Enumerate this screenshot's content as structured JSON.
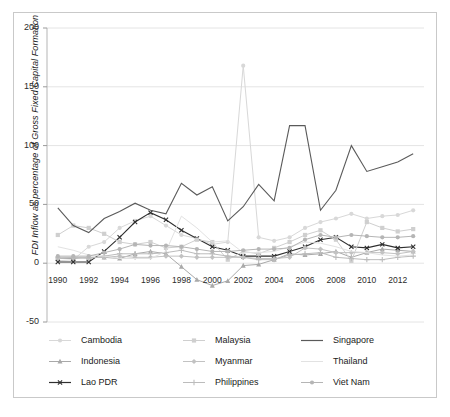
{
  "chart_data": {
    "type": "line",
    "title": "",
    "xlabel": "",
    "ylabel": "FDI Inflow as percentage of Gross Fixed Capital Formation",
    "x": [
      1990,
      1991,
      1992,
      1993,
      1994,
      1995,
      1996,
      1997,
      1998,
      1999,
      2000,
      2001,
      2002,
      2003,
      2004,
      2005,
      2006,
      2007,
      2008,
      2009,
      2010,
      2011,
      2012,
      2013
    ],
    "xlim": [
      1989.3,
      2013.7
    ],
    "ylim": [
      -50,
      200
    ],
    "yticks": [
      -50,
      0,
      50,
      100,
      150,
      200
    ],
    "xticks": [
      1990,
      1992,
      1994,
      1996,
      1998,
      2000,
      2002,
      2004,
      2006,
      2008,
      2010,
      2012
    ],
    "xtick_labels": [
      "1990",
      "1992",
      "1994",
      "1996",
      "1998",
      "2000",
      "2002",
      "2004",
      "2006",
      "2008",
      "2010",
      "2012"
    ],
    "ytick_labels": [
      "-50",
      "0",
      "50",
      "100",
      "150",
      "200"
    ],
    "grid": "horizontal",
    "legend_position": "bottom",
    "series": [
      {
        "name": "Cambodia",
        "color": "#d8d8d8",
        "marker": "circle",
        "values": [
          2,
          3,
          14,
          18,
          30,
          36,
          40,
          32,
          24,
          21,
          16,
          18,
          168,
          22,
          19,
          22,
          30,
          35,
          38,
          42,
          38,
          40,
          41,
          45
        ]
      },
      {
        "name": "Indonesia",
        "color": "#a9a9a9",
        "marker": "triangle",
        "values": [
          4,
          4,
          5,
          5,
          4,
          8,
          10,
          8,
          -3,
          -14,
          -19,
          -15,
          -2,
          -1,
          3,
          8,
          7,
          8,
          10,
          5,
          9,
          12,
          11,
          10
        ]
      },
      {
        "name": "Lao PDR",
        "color": "#2f2f2f",
        "marker": "x",
        "values": [
          1,
          1,
          1,
          10,
          22,
          35,
          43,
          37,
          28,
          21,
          14,
          11,
          6,
          6,
          6,
          10,
          14,
          20,
          22,
          14,
          13,
          16,
          13,
          14
        ]
      },
      {
        "name": "Malaysia",
        "color": "#cfcfcf",
        "marker": "square",
        "values": [
          24,
          32,
          30,
          25,
          18,
          16,
          18,
          13,
          14,
          20,
          18,
          3,
          10,
          8,
          13,
          18,
          24,
          28,
          20,
          2,
          35,
          30,
          27,
          29
        ]
      },
      {
        "name": "Myanmar",
        "color": "#c2c2c2",
        "marker": "diamond",
        "values": [
          4,
          5,
          5,
          5,
          6,
          5,
          5,
          6,
          6,
          5,
          5,
          5,
          5,
          4,
          4,
          5,
          13,
          12,
          9,
          9,
          9,
          9,
          8,
          10
        ]
      },
      {
        "name": "Philippines",
        "color": "#bcbcbc",
        "marker": "plus",
        "values": [
          5,
          5,
          4,
          6,
          8,
          8,
          8,
          9,
          11,
          8,
          8,
          6,
          5,
          3,
          3,
          7,
          8,
          9,
          5,
          4,
          3,
          3,
          5,
          6
        ]
      },
      {
        "name": "Singapore",
        "color": "#5a5a5a",
        "marker": "none",
        "values": [
          47,
          32,
          26,
          38,
          44,
          51,
          45,
          42,
          68,
          58,
          65,
          36,
          48,
          67,
          53,
          117,
          117,
          45,
          62,
          100,
          78,
          82,
          86,
          93
        ]
      },
      {
        "name": "Thailand",
        "color": "#e2e2e2",
        "marker": "none",
        "values": [
          14,
          11,
          7,
          6,
          4,
          4,
          4,
          10,
          40,
          30,
          18,
          19,
          9,
          9,
          10,
          14,
          18,
          17,
          14,
          10,
          9,
          7,
          6,
          7
        ]
      },
      {
        "name": "Viet Nam",
        "color": "#b5b5b5",
        "marker": "circle",
        "values": [
          6,
          6,
          6,
          9,
          12,
          16,
          15,
          15,
          14,
          12,
          10,
          10,
          11,
          12,
          12,
          13,
          20,
          24,
          22,
          24,
          23,
          22,
          22,
          23
        ]
      }
    ]
  },
  "legend": {
    "columns": [
      {
        "items": [
          "Cambodia",
          "Indonesia",
          "Lao PDR"
        ]
      },
      {
        "items": [
          "Malaysia",
          "Myanmar",
          "Philippines"
        ]
      },
      {
        "items": [
          "Singapore",
          "Thailand",
          "Viet Nam"
        ]
      }
    ]
  }
}
